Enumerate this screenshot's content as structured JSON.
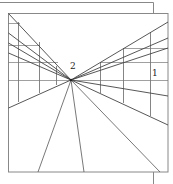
{
  "diagram": {
    "labels": [
      {
        "id": "vp-label",
        "text": "2",
        "x": 70,
        "y": 62
      },
      {
        "id": "side-label",
        "text": "1",
        "x": 152,
        "y": 69
      }
    ],
    "colors": {
      "line": "#555555",
      "frame": "#777777",
      "background": "#ffffff"
    },
    "vanishing_point": {
      "x": 71,
      "y": 80
    },
    "frame": {
      "x1": 8,
      "y1": 13,
      "x2": 168,
      "y2": 172
    }
  }
}
